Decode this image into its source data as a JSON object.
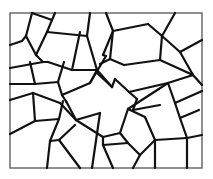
{
  "figure": {
    "frame": {
      "x": 10,
      "y": 13,
      "width": 192,
      "height": 155
    },
    "colors": {
      "line": "#111111",
      "frame": "#555555",
      "background": "#ffffff"
    },
    "edges": [
      [
        32,
        13,
        26,
        36
      ],
      [
        26,
        36,
        22,
        41
      ],
      [
        22,
        41,
        10,
        45
      ],
      [
        32,
        13,
        52,
        20
      ],
      [
        52,
        20,
        55,
        13
      ],
      [
        52,
        20,
        47,
        32
      ],
      [
        26,
        36,
        36,
        55
      ],
      [
        36,
        55,
        43,
        62
      ],
      [
        47,
        32,
        87,
        36
      ],
      [
        47,
        32,
        36,
        55
      ],
      [
        87,
        36,
        90,
        13
      ],
      [
        43,
        62,
        10,
        68
      ],
      [
        43,
        62,
        48,
        62
      ],
      [
        48,
        62,
        72,
        70
      ],
      [
        72,
        70,
        80,
        32
      ],
      [
        87,
        36,
        97,
        70
      ],
      [
        97,
        70,
        72,
        70
      ],
      [
        30,
        62,
        35,
        84
      ],
      [
        10,
        84,
        35,
        84
      ],
      [
        35,
        84,
        58,
        82
      ],
      [
        58,
        82,
        64,
        62
      ],
      [
        58,
        82,
        62,
        95
      ],
      [
        62,
        95,
        90,
        83
      ],
      [
        90,
        83,
        97,
        70
      ],
      [
        97,
        70,
        112,
        87
      ],
      [
        112,
        87,
        97,
        73
      ],
      [
        106,
        13,
        113,
        31
      ],
      [
        113,
        31,
        148,
        24
      ],
      [
        148,
        24,
        162,
        36
      ],
      [
        162,
        36,
        175,
        13
      ],
      [
        113,
        31,
        103,
        55
      ],
      [
        103,
        55,
        106,
        56
      ],
      [
        106,
        56,
        90,
        83
      ],
      [
        162,
        36,
        160,
        60
      ],
      [
        160,
        60,
        124,
        65
      ],
      [
        124,
        65,
        110,
        59
      ],
      [
        110,
        59,
        113,
        31
      ],
      [
        162,
        36,
        180,
        52
      ],
      [
        180,
        52,
        202,
        40
      ],
      [
        180,
        52,
        193,
        75
      ],
      [
        193,
        75,
        160,
        60
      ],
      [
        193,
        75,
        202,
        85
      ],
      [
        193,
        75,
        168,
        83
      ],
      [
        168,
        83,
        129,
        92
      ],
      [
        129,
        92,
        115,
        79
      ],
      [
        115,
        79,
        112,
        87
      ],
      [
        129,
        92,
        137,
        99
      ],
      [
        110,
        59,
        100,
        64
      ],
      [
        10,
        100,
        33,
        93
      ],
      [
        33,
        93,
        60,
        103
      ],
      [
        60,
        103,
        76,
        120
      ],
      [
        62,
        95,
        67,
        103
      ],
      [
        66,
        101,
        76,
        120
      ],
      [
        33,
        93,
        35,
        121
      ],
      [
        35,
        121,
        10,
        134
      ],
      [
        35,
        121,
        59,
        119
      ],
      [
        59,
        119,
        63,
        101
      ],
      [
        59,
        119,
        50,
        141
      ],
      [
        50,
        141,
        47,
        168
      ],
      [
        50,
        141,
        59,
        140
      ],
      [
        59,
        140,
        80,
        168
      ],
      [
        59,
        140,
        75,
        125
      ],
      [
        76,
        120,
        100,
        113
      ],
      [
        100,
        113,
        92,
        168
      ],
      [
        76,
        120,
        103,
        137
      ],
      [
        103,
        137,
        120,
        133
      ],
      [
        120,
        133,
        128,
        109
      ],
      [
        128,
        109,
        168,
        83
      ],
      [
        137,
        99,
        133,
        110
      ],
      [
        133,
        110,
        160,
        105
      ],
      [
        168,
        83,
        175,
        103
      ],
      [
        175,
        103,
        202,
        91
      ],
      [
        175,
        103,
        180,
        118
      ],
      [
        180,
        118,
        199,
        110
      ],
      [
        180,
        118,
        187,
        138
      ],
      [
        187,
        138,
        202,
        135
      ],
      [
        187,
        138,
        155,
        140
      ],
      [
        155,
        140,
        145,
        117
      ],
      [
        145,
        117,
        128,
        109
      ],
      [
        155,
        140,
        155,
        168
      ],
      [
        155,
        140,
        140,
        155
      ],
      [
        140,
        155,
        128,
        143
      ],
      [
        128,
        143,
        120,
        133
      ],
      [
        140,
        155,
        133,
        168
      ],
      [
        128,
        143,
        103,
        145
      ],
      [
        103,
        145,
        103,
        137
      ],
      [
        103,
        145,
        113,
        168
      ],
      [
        187,
        138,
        187,
        168
      ]
    ]
  }
}
